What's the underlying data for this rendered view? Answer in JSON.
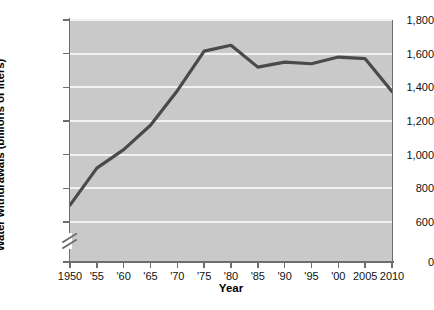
{
  "chart_data": {
    "type": "line",
    "title": "",
    "xlabel": "Year",
    "ylabel": "Water withdrawals (billions of liters)",
    "x": [
      1950,
      1955,
      1960,
      1965,
      1970,
      1975,
      1980,
      1985,
      1990,
      1995,
      2000,
      2005,
      2010
    ],
    "x_tick_labels": [
      "1950",
      "'55",
      "'60",
      "'65",
      "'70",
      "'75",
      "'80",
      "'85",
      "'90",
      "'95",
      "'00",
      "2005",
      "2010"
    ],
    "values": [
      700,
      920,
      1030,
      1175,
      1380,
      1615,
      1650,
      1520,
      1550,
      1540,
      1580,
      1570,
      1375
    ],
    "series": [
      {
        "name": "Water withdrawals",
        "values": [
          700,
          920,
          1030,
          1175,
          1380,
          1615,
          1650,
          1520,
          1550,
          1540,
          1580,
          1570,
          1375
        ]
      }
    ],
    "y_tick_labels": [
      "1,800",
      "1,600",
      "1,400",
      "1,200",
      "1,000",
      "800",
      "600",
      "0"
    ],
    "y_tick_values": [
      1800,
      1600,
      1400,
      1200,
      1000,
      800,
      600,
      0
    ],
    "ylim": [
      600,
      1800
    ],
    "xlim": [
      1950,
      2010
    ],
    "y_axis_break": true,
    "y_axis_break_between": [
      0,
      600
    ],
    "grid": "horizontal",
    "legend": "none",
    "colors": {
      "line": "#4a4a4a",
      "plot_background": "#c9c9c9",
      "gridline": "#f2f2f2",
      "axis": "#6e6e6e",
      "text": "#111111"
    }
  },
  "watermark": {
    "text": ""
  }
}
